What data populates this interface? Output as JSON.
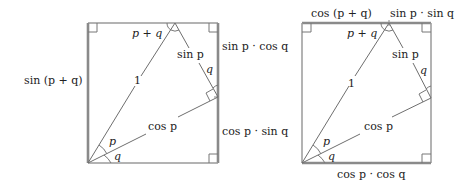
{
  "colors": {
    "background": "#ffffff",
    "thick_line": "#8a8a8a",
    "thin_line": "#6e6e6e",
    "text": "#222222"
  },
  "left_figure": {
    "labels": {
      "left_side": "sin (p + q)",
      "right_upper": "sin p · cos q",
      "right_lower": "cos p · sin q",
      "hypotenuse": "1",
      "top_angle": "p + q",
      "inner_upper_segment": "sin p",
      "inner_lower_segment": "cos p",
      "angle_right_q": "q",
      "angle_bottom_p": "p",
      "angle_bottom_q": "q"
    }
  },
  "right_figure": {
    "labels": {
      "top_left": "cos (p + q)",
      "top_right": "sin p · sin q",
      "bottom": "cos p · cos q",
      "hypotenuse": "1",
      "top_angle": "p + q",
      "inner_upper_segment": "sin p",
      "inner_lower_segment": "cos p",
      "angle_right_q": "q",
      "angle_bottom_p": "p",
      "angle_bottom_q": "q"
    }
  }
}
